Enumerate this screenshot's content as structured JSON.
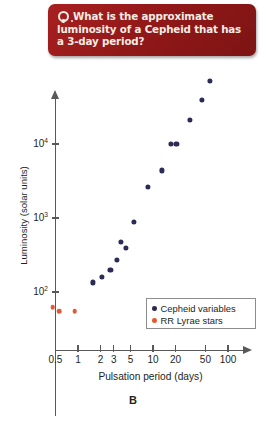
{
  "question": {
    "icon": "question-bubble-icon",
    "text": "What is the approximate luminosity of a Cepheid that has a 3-day period?",
    "background_color": "#9e1b1b",
    "text_color": "#f3ece4"
  },
  "panel_label": "B",
  "colors": {
    "cepheid": "#2b2b56",
    "rr_lyrae": "#e05a35",
    "axis": "#58595b"
  },
  "chart_data": {
    "type": "scatter",
    "title": "",
    "xlabel": "Pulsation period (days)",
    "ylabel": "Luminosity (solar units)",
    "xscale": "log",
    "yscale": "log",
    "xlim": [
      0.45,
      130
    ],
    "ylim": [
      40,
      100000
    ],
    "grid": false,
    "legend_position": "bottom-right",
    "xticks": [
      {
        "value": 0.5,
        "label": "0.5"
      },
      {
        "value": 1,
        "label": "1"
      },
      {
        "value": 2,
        "label": "2"
      },
      {
        "value": 3,
        "label": "3"
      },
      {
        "value": 5,
        "label": "5"
      },
      {
        "value": 10,
        "label": "10"
      },
      {
        "value": 20,
        "label": "20"
      },
      {
        "value": 50,
        "label": "50"
      },
      {
        "value": 100,
        "label": "100"
      }
    ],
    "yticks": [
      {
        "value": 100,
        "label": "10",
        "exponent": "2"
      },
      {
        "value": 1000,
        "label": "10",
        "exponent": "3"
      },
      {
        "value": 10000,
        "label": "10",
        "exponent": "4"
      }
    ],
    "series": [
      {
        "name": "Cepheid variables",
        "color": "#2b2b56",
        "points": [
          {
            "x": 1.6,
            "y": 135
          },
          {
            "x": 2.1,
            "y": 160
          },
          {
            "x": 2.7,
            "y": 200
          },
          {
            "x": 3.3,
            "y": 270
          },
          {
            "x": 3.7,
            "y": 480
          },
          {
            "x": 4.4,
            "y": 390
          },
          {
            "x": 5.6,
            "y": 880
          },
          {
            "x": 8.6,
            "y": 2600
          },
          {
            "x": 13.0,
            "y": 4400
          },
          {
            "x": 17.5,
            "y": 10000
          },
          {
            "x": 20.5,
            "y": 10000
          },
          {
            "x": 31.0,
            "y": 21000
          },
          {
            "x": 45.0,
            "y": 39000
          },
          {
            "x": 58.0,
            "y": 72000
          }
        ]
      },
      {
        "name": "RR Lyrae stars",
        "color": "#e05a35",
        "points": [
          {
            "x": 0.46,
            "y": 62
          },
          {
            "x": 0.56,
            "y": 55
          },
          {
            "x": 0.9,
            "y": 55
          }
        ]
      }
    ]
  }
}
